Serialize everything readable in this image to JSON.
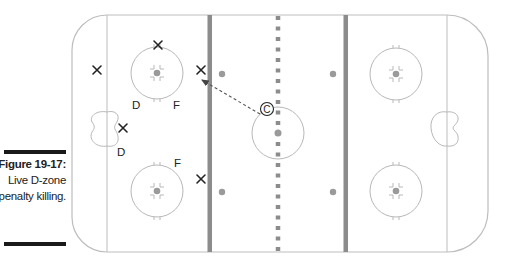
{
  "figure": {
    "number": "Figure 19-17:",
    "caption": "Live D-zone penalty killing."
  },
  "diagram": {
    "type": "hockey-rink-play-diagram",
    "colors": {
      "rink_lines": "#b8b8b8",
      "blue_lines": "#8c8c8c",
      "red_line": "#8c8c8c",
      "dots": "#9a9a9a",
      "players": "#222222",
      "arrow": "#555555"
    },
    "player_labels": {
      "d1": "D",
      "f1": "F",
      "d2": "D",
      "f2": "F",
      "opponent": "X",
      "center": "C"
    },
    "players": [
      {
        "id": "x1",
        "label": "X",
        "x": 158,
        "y": 45,
        "role": "opponent"
      },
      {
        "id": "x2",
        "label": "X",
        "x": 97,
        "y": 70,
        "role": "opponent"
      },
      {
        "id": "x3",
        "label": "X",
        "x": 201,
        "y": 70,
        "role": "opponent"
      },
      {
        "id": "x4",
        "label": "X",
        "x": 123,
        "y": 128,
        "role": "opponent"
      },
      {
        "id": "x5",
        "label": "X",
        "x": 201,
        "y": 179,
        "role": "opponent"
      },
      {
        "id": "d1",
        "label": "D",
        "x": 137,
        "y": 104,
        "role": "defense"
      },
      {
        "id": "f1",
        "label": "F",
        "x": 177,
        "y": 104,
        "role": "forward"
      },
      {
        "id": "d2",
        "label": "D",
        "x": 121,
        "y": 151,
        "role": "defense"
      },
      {
        "id": "f2",
        "label": "F",
        "x": 178,
        "y": 162,
        "role": "forward"
      },
      {
        "id": "c",
        "label": "C",
        "x": 267,
        "y": 110,
        "role": "center-circled"
      }
    ],
    "arrows": [
      {
        "from": [
          260,
          114
        ],
        "to": [
          202,
          80
        ],
        "style": "dashed"
      }
    ]
  }
}
